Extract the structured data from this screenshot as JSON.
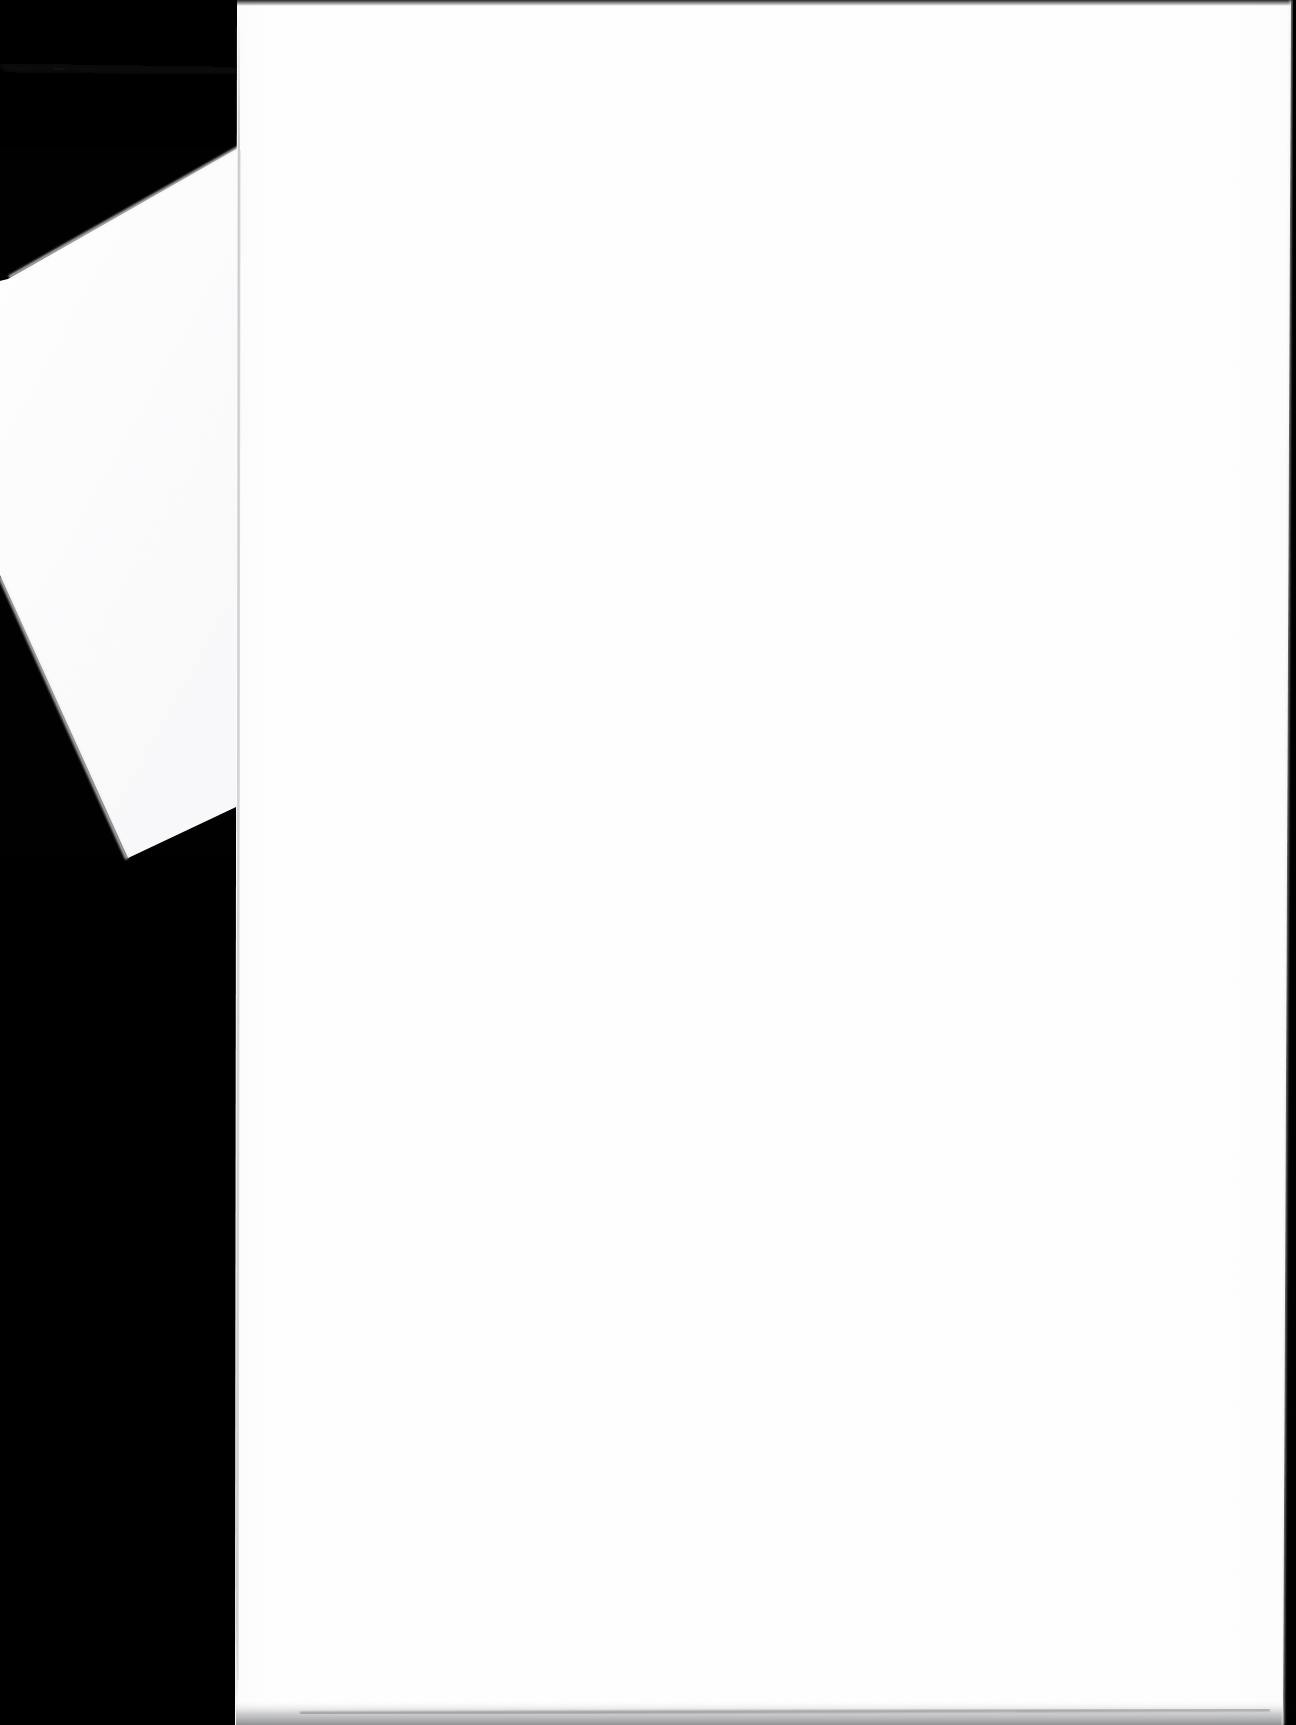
{
  "document": {
    "kind": "scanned-page-image",
    "title": "Scanned blank document page",
    "page_content_text": "",
    "visible_text": [],
    "orientation": "portrait",
    "canvas": {
      "width": 1296,
      "height": 1725
    }
  },
  "colors": {
    "scanner_background": "#000000",
    "page_paper": "#ffffff",
    "page_paper_warm": "#fdfdfd",
    "secondary_sheet": "#fcfcfd",
    "page_edge_line": "#c9cace",
    "page_edge_line_soft": "#dddee1",
    "bottom_shadow": "#7d7e82",
    "faint_stack_line": "#1b1b1b"
  },
  "regions": {
    "background": {
      "name": "scanner-bed-background",
      "description": "Solid black scanner lid / bed surrounding the sheets"
    },
    "main_page": {
      "name": "main-scanned-page",
      "description": "Large blank white sheet, slightly rotated, filling most of the frame",
      "corners": "237,0 1291,0 1283,1725 235,1725",
      "blank": true
    },
    "secondary_sheet": {
      "name": "secondary-sheet-corner",
      "description": "Second white sheet visible at the left, angled, partly occluded",
      "corners": "238,148 238,806 128,858 0,575 0,281 8,279"
    },
    "bottom_shadow": {
      "name": "page-bottom-shadow",
      "description": "Faint gray shadow band along the lower edge of the main page"
    },
    "left_edge_line": {
      "name": "page-left-edge-line",
      "description": "Thin light-gray vertical seam marking the main page left edge"
    },
    "stack_line": {
      "name": "paper-stack-edge-line",
      "description": "Very faint dark line across the upper black area suggesting a paper stack edge"
    }
  }
}
